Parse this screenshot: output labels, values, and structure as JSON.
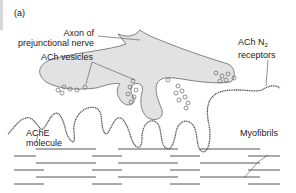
{
  "figure": {
    "panel_label": "(a)",
    "labels": {
      "axon": [
        "Axon of",
        "prejunctional nerve"
      ],
      "ach_vesicles": "ACh vesicles",
      "ach_receptors_main": "ACh N",
      "ach_receptors_sub": "2",
      "ach_receptors_line2": "receptors",
      "ache": [
        "AChE",
        "molecule"
      ],
      "myofibrils": "Myofibrils"
    },
    "colors": {
      "nerve_fill": "#e2e2e2",
      "outline": "#555555",
      "text": "#222222"
    }
  }
}
